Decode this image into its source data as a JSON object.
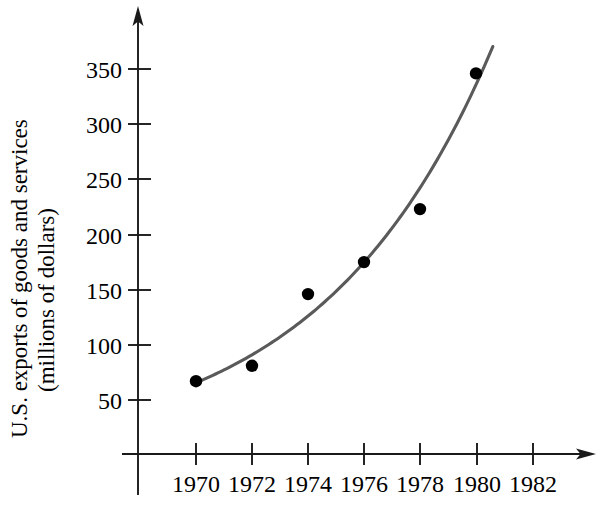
{
  "chart_data": {
    "type": "scatter",
    "title": "",
    "subtitle": "",
    "xlabel": "",
    "ylabel": "U.S. exports of goods and services (millions of dollars)",
    "ylabel_line1": "U.S. exports of goods and services",
    "ylabel_line2": "(millions of dollars)",
    "x": [
      1970,
      1972,
      1974,
      1976,
      1978,
      1980
    ],
    "values": [
      67,
      81,
      146,
      175,
      223,
      346
    ],
    "points": [
      {
        "x": 1970,
        "y": 67
      },
      {
        "x": 1972,
        "y": 81
      },
      {
        "x": 1974,
        "y": 146
      },
      {
        "x": 1976,
        "y": 175
      },
      {
        "x": 1978,
        "y": 223
      },
      {
        "x": 1980,
        "y": 346
      }
    ],
    "xticks": [
      1970,
      1972,
      1974,
      1976,
      1978,
      1980,
      1982
    ],
    "xtick_labels": [
      "1970",
      "1972",
      "1974",
      "1976",
      "1978",
      "1980",
      "1982"
    ],
    "yticks": [
      50,
      100,
      150,
      200,
      250,
      300,
      350
    ],
    "ytick_labels": [
      "50",
      "100",
      "150",
      "200",
      "250",
      "300",
      "350"
    ],
    "xlim": [
      1969.0,
      1983.2
    ],
    "ylim": [
      0,
      375
    ],
    "grid": false,
    "legend": null,
    "series": [
      {
        "name": "U.S. exports of goods and services",
        "values": [
          67,
          81,
          146,
          175,
          223,
          346
        ],
        "marker": "filled-circle",
        "marker_color": "#000000"
      },
      {
        "name": "fitted exponential trend curve",
        "style": "smooth-curve",
        "color": "#5a5a5a"
      }
    ],
    "annotations": [],
    "axis_arrows": [
      "x-axis-right",
      "y-axis-up"
    ]
  },
  "colors": {
    "axis": "#1a1a1a",
    "curve": "#5a5a5a",
    "point": "#000000",
    "background": "#ffffff"
  }
}
